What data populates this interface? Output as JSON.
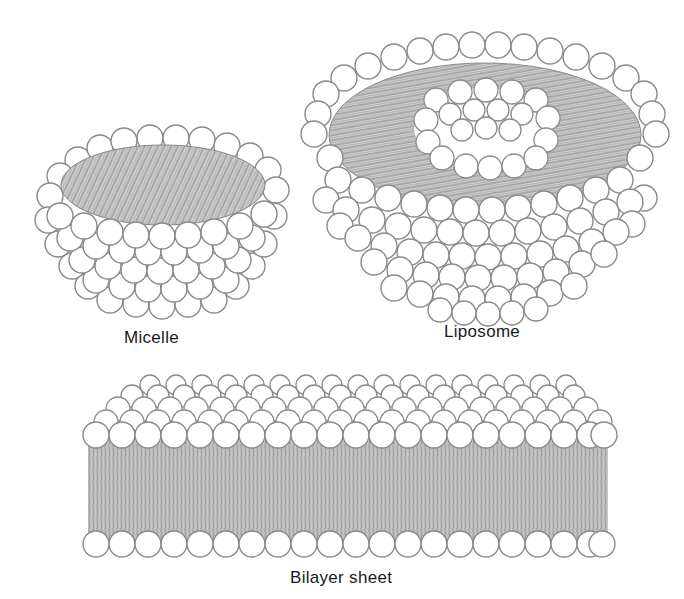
{
  "diagram": {
    "structures": [
      {
        "id": "micelle",
        "label": "Micelle"
      },
      {
        "id": "liposome",
        "label": "Liposome"
      },
      {
        "id": "bilayer",
        "label": "Bilayer sheet"
      }
    ]
  },
  "colors": {
    "head_fill": "#ffffff",
    "head_stroke": "#8a8a8a",
    "tail_region": "#c9c9c9",
    "tail_lines": "#7a7a7a",
    "label_text": "#1a1a1a"
  }
}
